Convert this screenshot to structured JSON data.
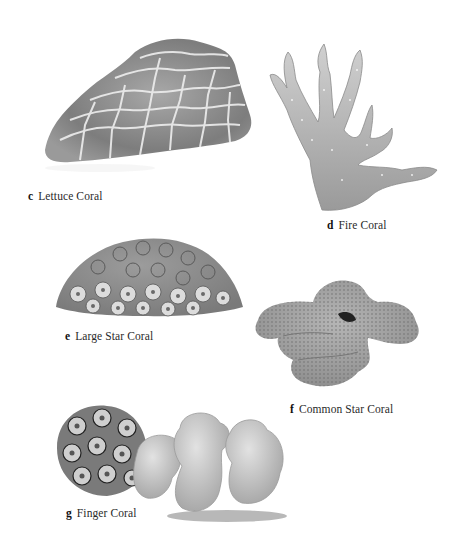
{
  "plate": {
    "items": [
      {
        "letter": "c",
        "name": "Lettuce Coral"
      },
      {
        "letter": "d",
        "name": "Fire Coral"
      },
      {
        "letter": "e",
        "name": "Large Star Coral"
      },
      {
        "letter": "f",
        "name": "Common Star Coral"
      },
      {
        "letter": "g",
        "name": "Finger Coral"
      }
    ]
  },
  "colors": {
    "background": "#ffffff",
    "coral_dark": "#6e6e6e",
    "coral_mid": "#9a9a9a",
    "coral_light": "#c8c8c8",
    "ridge": "#f0f0f0"
  }
}
